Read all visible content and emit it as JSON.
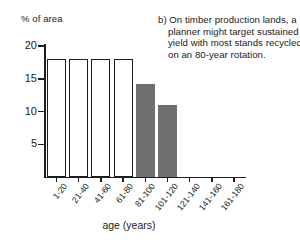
{
  "chart_data": {
    "type": "bar",
    "title": "",
    "xlabel": "age (years)",
    "ylabel": "% of area",
    "categories": [
      "1-20",
      "21-40",
      "41-60",
      "61-80",
      "81-100",
      "101-120",
      "121-140",
      "141-160",
      "161-180"
    ],
    "values": [
      18,
      18,
      18,
      18,
      14.2,
      11,
      0,
      0,
      0
    ],
    "bar_styles": [
      "open",
      "open",
      "open",
      "open",
      "filled",
      "filled",
      "empty",
      "empty",
      "empty"
    ],
    "ylim": [
      0,
      20
    ],
    "yticks": [
      5,
      10,
      15,
      20
    ],
    "ytick_labels": [
      "5",
      "10",
      "15",
      "20"
    ],
    "grid": false,
    "legend": "none",
    "colors": {
      "axis": "#1d1d1d",
      "bar_open_fill": "#ffffff",
      "bar_open_edge": "#1d1d1d",
      "bar_filled_fill": "#6f6f6f",
      "background": "#ffffff",
      "text": "#1a1a1a"
    }
  },
  "caption": {
    "label": "b)",
    "text": "b) On timber production lands, a planner might target sustained yield with most stands recycled on an 80-year rotation."
  }
}
